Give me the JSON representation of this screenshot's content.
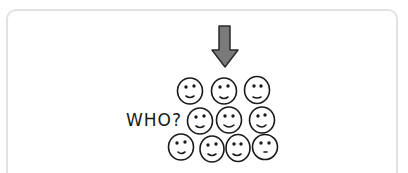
{
  "illustration": {
    "label": "WHO?",
    "arrow": {
      "icon": "down-arrow-icon",
      "color": "#7a7a7a",
      "stroke": "#2a2a2a"
    },
    "faces": {
      "icon": "smiley-face-icon",
      "count": 10,
      "rows": [
        {
          "count": 3
        },
        {
          "count": 3
        },
        {
          "count": 4
        }
      ]
    },
    "colors": {
      "ink": "#1a1a1a",
      "frame": "#e2e2e2",
      "background": "#ffffff"
    }
  }
}
